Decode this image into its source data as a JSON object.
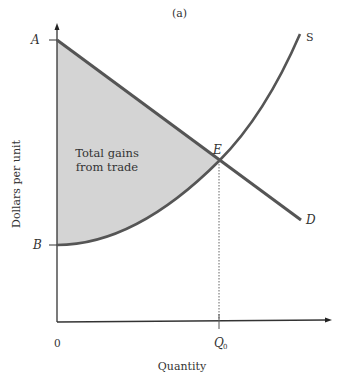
{
  "figure": {
    "panel_label": "(a)",
    "y_axis_label": "Dollars per unit",
    "x_axis_label": "Quantity",
    "origin_label": "0",
    "points": {
      "A": "A",
      "B": "B",
      "E": "E"
    },
    "curves": {
      "supply": "S",
      "demand": "D"
    },
    "quantity_tick": {
      "main": "Q",
      "subscript": "0"
    },
    "region_label_line1": "Total gains",
    "region_label_line2": "from trade"
  },
  "colors": {
    "curve": "#555555",
    "axis": "#333333",
    "shaded_region": "#d4d4d4",
    "text": "#333333"
  }
}
